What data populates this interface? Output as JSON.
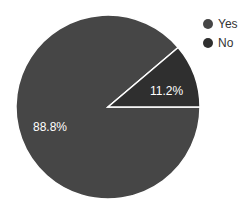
{
  "chart_data": {
    "type": "pie",
    "title": "",
    "categories": [
      "Yes",
      "No"
    ],
    "values": [
      88.8,
      11.2
    ],
    "labels": [
      "88.8%",
      "11.2%"
    ],
    "colors": [
      "#464646",
      "#2f2f2f"
    ],
    "legend_position": "right",
    "start_angle_deg": 0,
    "direction": "clockwise"
  },
  "legend": {
    "items": [
      {
        "label": "Yes",
        "color": "#464646"
      },
      {
        "label": "No",
        "color": "#2f2f2f"
      }
    ]
  }
}
